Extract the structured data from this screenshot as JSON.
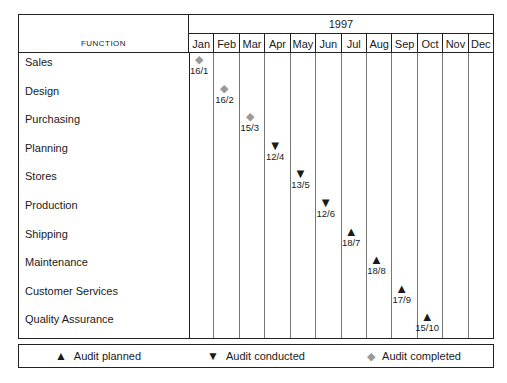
{
  "table": {
    "function_header": "FUNCTION",
    "year_header": "1997",
    "months": [
      "Jan",
      "Feb",
      "Mar",
      "Apr",
      "May",
      "Jun",
      "Jul",
      "Aug",
      "Sep",
      "Oct",
      "Nov",
      "Dec"
    ],
    "rows": [
      {
        "function": "Sales",
        "month_index": 0,
        "label": "16/1",
        "marker": "diamond"
      },
      {
        "function": "Design",
        "month_index": 1,
        "label": "16/2",
        "marker": "diamond"
      },
      {
        "function": "Purchasing",
        "month_index": 2,
        "label": "15/3",
        "marker": "diamond"
      },
      {
        "function": "Planning",
        "month_index": 3,
        "label": "12/4",
        "marker": "tri-down"
      },
      {
        "function": "Stores",
        "month_index": 4,
        "label": "13/5",
        "marker": "tri-down"
      },
      {
        "function": "Production",
        "month_index": 5,
        "label": "12/6",
        "marker": "tri-down"
      },
      {
        "function": "Shipping",
        "month_index": 6,
        "label": "18/7",
        "marker": "tri-up"
      },
      {
        "function": "Maintenance",
        "month_index": 7,
        "label": "18/8",
        "marker": "tri-up"
      },
      {
        "function": "Customer Services",
        "month_index": 8,
        "label": "17/9",
        "marker": "tri-up"
      },
      {
        "function": "Quality Assurance",
        "month_index": 9,
        "label": "15/10",
        "marker": "tri-up"
      }
    ]
  },
  "legend": {
    "items": [
      {
        "marker": "tri-up",
        "label": "Audit planned"
      },
      {
        "marker": "tri-down",
        "label": "Audit conducted"
      },
      {
        "marker": "diamond",
        "label": "Audit completed"
      }
    ]
  },
  "glyphs": {
    "tri-up": "▲",
    "tri-down": "▼",
    "diamond": "◆"
  },
  "colors": {
    "planned": "#1a1a1a",
    "conducted": "#1a1a1a",
    "completed": "#9a9a9a",
    "border": "#222222",
    "grid": "#777777",
    "background": "#ffffff"
  }
}
